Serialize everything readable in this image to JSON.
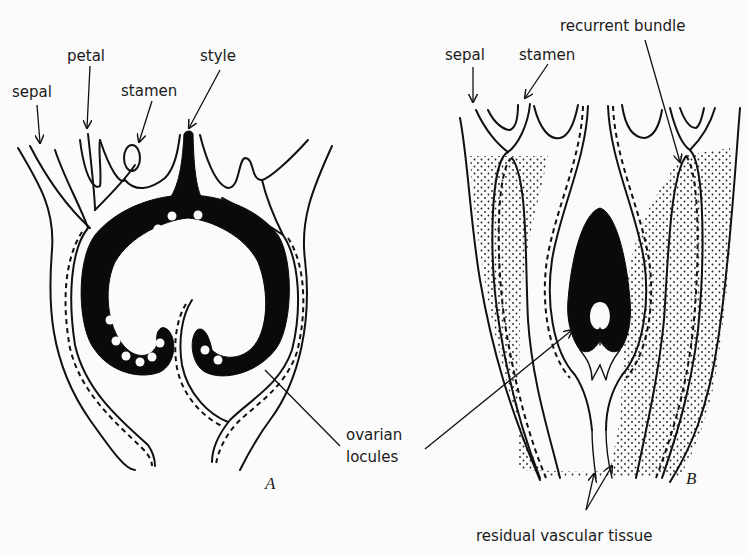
{
  "figure": {
    "panels": [
      {
        "id": "A",
        "letter": "A",
        "labels": {
          "sepal": "sepal",
          "petal": "petal",
          "stamen": "stamen",
          "style": "style"
        }
      },
      {
        "id": "B",
        "letter": "B",
        "labels": {
          "sepal": "sepal",
          "stamen": "stamen",
          "recurrent_bundle": "recurrent bundle"
        }
      }
    ],
    "shared_labels": {
      "ovarian_line1": "ovarian",
      "ovarian_line2": "locules",
      "residual": "residual vascular tissue"
    },
    "colors": {
      "background": "#fbfbfb",
      "ink": "#111111"
    }
  }
}
